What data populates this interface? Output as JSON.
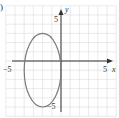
{
  "figure": {
    "panel_label": ")"
  },
  "chart_data": {
    "type": "line",
    "title": "",
    "xlabel": "x",
    "ylabel": "y",
    "xlim": [
      -5,
      5
    ],
    "ylim": [
      -5,
      5
    ],
    "grid": true,
    "tick_labels": {
      "x_min": "−5",
      "x_max": "5",
      "y_max": "5",
      "y_min": "−5"
    },
    "series": [
      {
        "name": "ellipse",
        "shape": "ellipse",
        "center": [
          -2,
          -1
        ],
        "semi_axis_x": 2,
        "semi_axis_y": 4,
        "equation": "(x+2)^2/4 + (y+1)^2/16 = 1",
        "color": "#7a7a7a"
      }
    ],
    "colors": {
      "grid": "#dcdcdc",
      "axis": "#333333",
      "curve": "#7a7a7a"
    }
  }
}
